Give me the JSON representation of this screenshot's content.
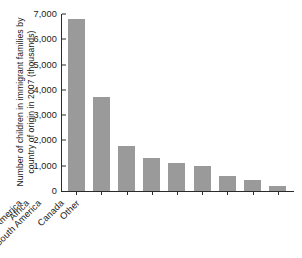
{
  "chart_data": {
    "type": "bar",
    "title": "",
    "xlabel": "",
    "ylabel": "Number of children in immigrant families by country of origin in 2007 (thousands)",
    "categories": [
      "Mexico",
      "Asia",
      "Europe",
      "Caribbean",
      "Central America",
      "South America",
      "Africa",
      "Canada",
      "Other"
    ],
    "values": [
      6800,
      3700,
      1800,
      1300,
      1100,
      1000,
      600,
      450,
      200
    ],
    "ylim": [
      0,
      7000
    ],
    "ytick_values": [
      0,
      1000,
      2000,
      3000,
      4000,
      5000,
      6000,
      7000
    ],
    "ytick_labels": [
      "0",
      "1,000",
      "2,000",
      "3,000",
      "4,000",
      "5,000",
      "6,000",
      "7,000"
    ],
    "grid": false,
    "legend": false,
    "bar_color": "#9a9a9a",
    "axis_color": "#2b2b2b",
    "background_color": "#ffffff",
    "xtick_label_rotation": -45
  }
}
